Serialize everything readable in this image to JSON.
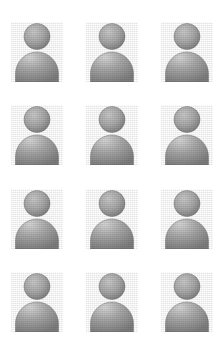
{
  "page": {
    "background_color": "#ffffff",
    "width": 224,
    "height": 355
  },
  "grid": {
    "columns": 3,
    "rows": 4,
    "total_items": 12
  },
  "avatar": {
    "icon_name": "user-avatar-icon",
    "label": "User",
    "shape": "person-silhouette",
    "head_shape": "circle",
    "body_shape": "dome",
    "fill_light": "#c9c9c9",
    "fill_mid": "#a8a8a8",
    "fill_dark": "#7d7d7d",
    "outline_color": "#6f6f6f",
    "texture": "grain"
  },
  "items": [
    {
      "id": 1,
      "label": "User",
      "row": 1,
      "column": 1
    },
    {
      "id": 2,
      "label": "User",
      "row": 1,
      "column": 2
    },
    {
      "id": 3,
      "label": "User",
      "row": 1,
      "column": 3
    },
    {
      "id": 4,
      "label": "User",
      "row": 2,
      "column": 1
    },
    {
      "id": 5,
      "label": "User",
      "row": 2,
      "column": 2
    },
    {
      "id": 6,
      "label": "User",
      "row": 2,
      "column": 3
    },
    {
      "id": 7,
      "label": "User",
      "row": 3,
      "column": 1
    },
    {
      "id": 8,
      "label": "User",
      "row": 3,
      "column": 2
    },
    {
      "id": 9,
      "label": "User",
      "row": 3,
      "column": 3
    },
    {
      "id": 10,
      "label": "User",
      "row": 4,
      "column": 1
    },
    {
      "id": 11,
      "label": "User",
      "row": 4,
      "column": 2
    },
    {
      "id": 12,
      "label": "User",
      "row": 4,
      "column": 3
    }
  ]
}
